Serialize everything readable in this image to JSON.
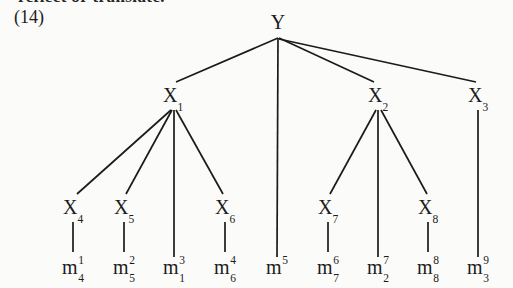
{
  "figure": {
    "cut_text_above": "reflect or translate.",
    "equation_number": "(14)",
    "type": "tree-diagram",
    "ink_color": "#1b1b1b",
    "background_color": "#fbfbfa"
  },
  "nodes": {
    "root": {
      "id": "Y",
      "base": "Y",
      "sub": "",
      "sup": "",
      "x": 278,
      "y": 22
    },
    "level1": [
      {
        "id": "X1",
        "base": "X",
        "sub": "1",
        "sup": "",
        "x": 173,
        "y": 95
      },
      {
        "id": "X2",
        "base": "X",
        "sub": "2",
        "sup": "",
        "x": 378,
        "y": 95
      },
      {
        "id": "X3",
        "base": "X",
        "sub": "3",
        "sup": "",
        "x": 478,
        "y": 95
      }
    ],
    "level2": [
      {
        "id": "X4",
        "base": "X",
        "sub": "4",
        "sup": "",
        "x": 73,
        "y": 207
      },
      {
        "id": "X5",
        "base": "X",
        "sub": "5",
        "sup": "",
        "x": 124,
        "y": 207
      },
      {
        "id": "X6",
        "base": "X",
        "sub": "6",
        "sup": "",
        "x": 225,
        "y": 207
      },
      {
        "id": "X7",
        "base": "X",
        "sub": "7",
        "sup": "",
        "x": 328,
        "y": 207
      },
      {
        "id": "X8",
        "base": "X",
        "sub": "8",
        "sup": "",
        "x": 428,
        "y": 207
      }
    ],
    "leaves": [
      {
        "id": "m1",
        "base": "m",
        "sub": "4",
        "sup": "1",
        "x": 73,
        "y": 269
      },
      {
        "id": "m2",
        "base": "m",
        "sub": "5",
        "sup": "2",
        "x": 124,
        "y": 269
      },
      {
        "id": "m3",
        "base": "m",
        "sub": "1",
        "sup": "3",
        "x": 174,
        "y": 269
      },
      {
        "id": "m4",
        "base": "m",
        "sub": "6",
        "sup": "4",
        "x": 225,
        "y": 269
      },
      {
        "id": "m5",
        "base": "m",
        "sub": "",
        "sup": "5",
        "x": 277,
        "y": 269
      },
      {
        "id": "m6",
        "base": "m",
        "sub": "7",
        "sup": "6",
        "x": 328,
        "y": 269
      },
      {
        "id": "m7",
        "base": "m",
        "sub": "2",
        "sup": "7",
        "x": 378,
        "y": 269
      },
      {
        "id": "m8",
        "base": "m",
        "sub": "8",
        "sup": "8",
        "x": 428,
        "y": 269
      },
      {
        "id": "m9",
        "base": "m",
        "sub": "3",
        "sup": "9",
        "x": 478,
        "y": 269
      }
    ]
  },
  "edges": [
    {
      "from": "Y",
      "to": "X1",
      "x1": 278,
      "y1": 38,
      "x2": 176,
      "y2": 82
    },
    {
      "from": "Y",
      "to": "m5",
      "x1": 278,
      "y1": 38,
      "x2": 277,
      "y2": 257
    },
    {
      "from": "Y",
      "to": "X2",
      "x1": 279,
      "y1": 38,
      "x2": 374,
      "y2": 82
    },
    {
      "from": "Y",
      "to": "X3",
      "x1": 279,
      "y1": 39,
      "x2": 476,
      "y2": 82
    },
    {
      "from": "X1",
      "to": "X4",
      "x1": 171,
      "y1": 110,
      "x2": 77,
      "y2": 194
    },
    {
      "from": "X1",
      "to": "X5",
      "x1": 172,
      "y1": 110,
      "x2": 126,
      "y2": 194
    },
    {
      "from": "X1",
      "to": "m3",
      "x1": 174,
      "y1": 110,
      "x2": 174,
      "y2": 257
    },
    {
      "from": "X1",
      "to": "X6",
      "x1": 176,
      "y1": 110,
      "x2": 223,
      "y2": 194
    },
    {
      "from": "X2",
      "to": "X7",
      "x1": 376,
      "y1": 110,
      "x2": 330,
      "y2": 194
    },
    {
      "from": "X2",
      "to": "m7",
      "x1": 378,
      "y1": 110,
      "x2": 378,
      "y2": 257
    },
    {
      "from": "X2",
      "to": "X8",
      "x1": 381,
      "y1": 110,
      "x2": 427,
      "y2": 194
    },
    {
      "from": "X3",
      "to": "m9",
      "x1": 478,
      "y1": 110,
      "x2": 478,
      "y2": 257
    },
    {
      "from": "X4",
      "to": "m1",
      "x1": 73,
      "y1": 222,
      "x2": 73,
      "y2": 252
    },
    {
      "from": "X5",
      "to": "m2",
      "x1": 124,
      "y1": 222,
      "x2": 124,
      "y2": 252
    },
    {
      "from": "X6",
      "to": "m4",
      "x1": 225,
      "y1": 222,
      "x2": 225,
      "y2": 252
    },
    {
      "from": "X7",
      "to": "m6",
      "x1": 328,
      "y1": 222,
      "x2": 328,
      "y2": 252
    },
    {
      "from": "X8",
      "to": "m8",
      "x1": 428,
      "y1": 222,
      "x2": 428,
      "y2": 252
    }
  ]
}
